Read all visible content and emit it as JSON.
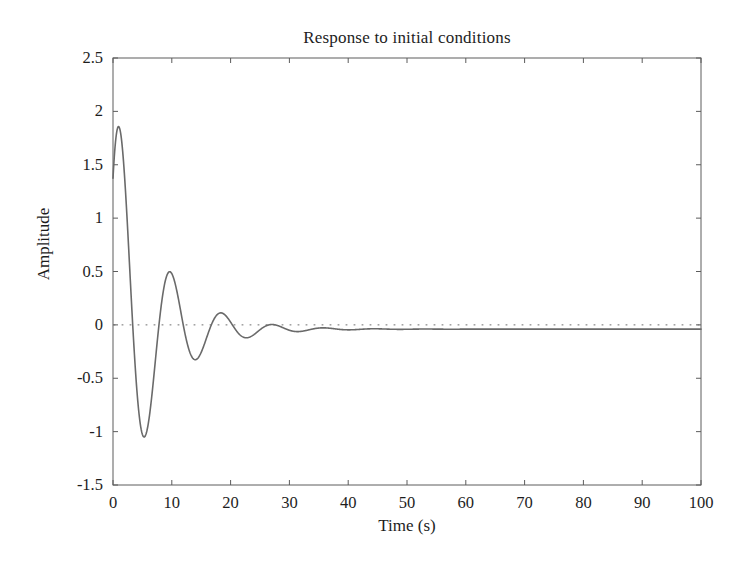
{
  "figure": {
    "background_color": "#ffffff",
    "frame_color": "#5c5c5c",
    "text_color": "#1d1d1d"
  },
  "chart_data": {
    "type": "line",
    "title": "Response to initial conditions",
    "xlabel": "Time (s)",
    "ylabel": "Amplitude",
    "xlim": [
      0,
      100
    ],
    "ylim": [
      -1.5,
      2.5
    ],
    "xticks": [
      0,
      10,
      20,
      30,
      40,
      50,
      60,
      70,
      80,
      90,
      100
    ],
    "xtick_labels": [
      "0",
      "10",
      "20",
      "30",
      "40",
      "50",
      "60",
      "70",
      "80",
      "90",
      "100"
    ],
    "yticks": [
      -1.5,
      -1,
      -0.5,
      0,
      0.5,
      1,
      1.5,
      2,
      2.5
    ],
    "ytick_labels": [
      "-1.5",
      "-1",
      "-0.5",
      "0",
      "0.5",
      "1",
      "1.5",
      "2",
      "2.5"
    ],
    "grid": false,
    "legend": null,
    "zero_reference_line": {
      "value": 0,
      "style": "dotted",
      "color": "#6e6e6e"
    },
    "series": [
      {
        "name": "response",
        "color": "#6a6a6a",
        "line_width": 1.6,
        "description": "Damped oscillation decaying to a small negative steady-state offset",
        "model": {
          "form": "offset + amplitude * exp(-decay*t) * cos(omega*t + phase)",
          "offset": -0.04,
          "amplitude": 2.22,
          "decay": 0.145,
          "omega": 0.7225,
          "phase": -0.88
        },
        "features": {
          "initial_value": 1.33,
          "peaks": [
            {
              "t": 2.1,
              "y": 2.1
            },
            {
              "t": 10.7,
              "y": 0.85
            },
            {
              "t": 19.4,
              "y": 0.33
            },
            {
              "t": 28.1,
              "y": 0.13
            },
            {
              "t": 36.8,
              "y": 0.04
            },
            {
              "t": 45.5,
              "y": 0.0
            }
          ],
          "troughs": [
            {
              "t": 6.4,
              "y": -1.37
            },
            {
              "t": 15.1,
              "y": -0.57
            },
            {
              "t": 23.8,
              "y": -0.24
            },
            {
              "t": 32.5,
              "y": -0.11
            },
            {
              "t": 41.2,
              "y": -0.07
            }
          ],
          "settling_value": -0.04,
          "settling_time": 55
        },
        "points": [
          [
            0,
            1.33
          ],
          [
            0.5,
            1.62
          ],
          [
            1,
            1.86
          ],
          [
            1.5,
            2.02
          ],
          [
            2,
            2.1
          ],
          [
            2.5,
            2.09
          ],
          [
            3,
            1.99
          ],
          [
            3.5,
            1.8
          ],
          [
            4,
            1.53
          ],
          [
            4.5,
            1.19
          ],
          [
            5,
            0.8
          ],
          [
            5.5,
            0.39
          ],
          [
            6,
            -0.02
          ],
          [
            6.5,
            -0.41
          ],
          [
            7,
            -0.74
          ],
          [
            7.5,
            -1.02
          ],
          [
            8,
            -1.22
          ],
          [
            8.5,
            -1.33
          ],
          [
            9,
            -1.37
          ],
          [
            9.5,
            -1.32
          ],
          [
            10,
            -1.2
          ],
          [
            10.5,
            -1.02
          ],
          [
            11,
            -0.79
          ],
          [
            11.5,
            -0.53
          ],
          [
            12,
            -0.26
          ],
          [
            12.5,
            0.02
          ],
          [
            13,
            0.28
          ],
          [
            13.5,
            0.5
          ],
          [
            14,
            0.68
          ],
          [
            14.5,
            0.8
          ],
          [
            15,
            0.85
          ],
          [
            15.5,
            0.85
          ],
          [
            16,
            0.79
          ],
          [
            16.5,
            0.68
          ],
          [
            17,
            0.53
          ],
          [
            17.5,
            0.36
          ],
          [
            18,
            0.17
          ],
          [
            18.5,
            -0.02
          ],
          [
            19,
            -0.2
          ],
          [
            19.5,
            -0.36
          ],
          [
            20,
            -0.48
          ],
          [
            20.5,
            -0.56
          ],
          [
            21,
            -0.58
          ],
          [
            21.5,
            -0.57
          ],
          [
            22,
            -0.52
          ],
          [
            22.5,
            -0.43
          ],
          [
            23,
            -0.32
          ],
          [
            23.5,
            -0.2
          ],
          [
            24,
            -0.08
          ],
          [
            24.5,
            0.05
          ],
          [
            25,
            0.15
          ],
          [
            25.5,
            0.24
          ],
          [
            26,
            0.3
          ],
          [
            26.5,
            0.33
          ],
          [
            27,
            0.33
          ],
          [
            27.5,
            0.31
          ],
          [
            28,
            0.26
          ],
          [
            28.5,
            0.2
          ],
          [
            29,
            0.12
          ],
          [
            29.5,
            0.04
          ],
          [
            30,
            -0.03
          ],
          [
            30.5,
            -0.1
          ],
          [
            31,
            -0.16
          ],
          [
            31.5,
            -0.21
          ],
          [
            32,
            -0.23
          ],
          [
            32.5,
            -0.24
          ],
          [
            33,
            -0.23
          ],
          [
            33.5,
            -0.2
          ],
          [
            34,
            -0.16
          ],
          [
            34.5,
            -0.1
          ],
          [
            35,
            -0.05
          ],
          [
            35.5,
            0.01
          ],
          [
            36,
            0.06
          ],
          [
            36.5,
            0.1
          ],
          [
            37,
            0.12
          ],
          [
            37.5,
            0.13
          ],
          [
            38,
            0.13
          ],
          [
            38.5,
            0.11
          ],
          [
            39,
            0.08
          ],
          [
            39.5,
            0.05
          ],
          [
            40,
            0.01
          ],
          [
            41,
            -0.06
          ],
          [
            42,
            -0.1
          ],
          [
            43,
            -0.11
          ],
          [
            44,
            -0.09
          ],
          [
            45,
            -0.06
          ],
          [
            46,
            -0.02
          ],
          [
            47,
            0.01
          ],
          [
            48,
            0.03
          ],
          [
            49,
            0.04
          ],
          [
            50,
            0.03
          ],
          [
            51,
            0.01
          ],
          [
            52,
            -0.01
          ],
          [
            53,
            -0.03
          ],
          [
            54,
            -0.05
          ],
          [
            55,
            -0.06
          ],
          [
            56,
            -0.06
          ],
          [
            57,
            -0.05
          ],
          [
            58,
            -0.04
          ],
          [
            59,
            -0.03
          ],
          [
            60,
            -0.03
          ],
          [
            62,
            -0.03
          ],
          [
            64,
            -0.04
          ],
          [
            66,
            -0.04
          ],
          [
            68,
            -0.04
          ],
          [
            70,
            -0.04
          ],
          [
            75,
            -0.04
          ],
          [
            80,
            -0.04
          ],
          [
            85,
            -0.04
          ],
          [
            90,
            -0.04
          ],
          [
            95,
            -0.04
          ],
          [
            100,
            -0.04
          ]
        ]
      }
    ]
  }
}
